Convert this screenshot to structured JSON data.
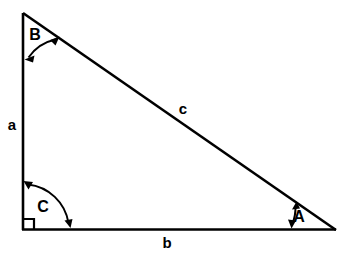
{
  "diagram": {
    "type": "right-triangle",
    "background_color": "#ffffff",
    "stroke_color": "#000000",
    "angles": [
      {
        "id": "A",
        "label": "A",
        "vertex": "bottom-right",
        "label_x": 299,
        "label_y": 218,
        "marker": "double-headed-arc"
      },
      {
        "id": "B",
        "label": "B",
        "vertex": "top",
        "label_x": 35,
        "label_y": 36,
        "marker": "double-headed-arc"
      },
      {
        "id": "C",
        "label": "C",
        "vertex": "bottom-left",
        "label_x": 43,
        "label_y": 208,
        "marker": "double-headed-arc",
        "right_angle": true
      }
    ],
    "sides": [
      {
        "id": "a",
        "label": "a",
        "position": "left-vertical",
        "label_x": 12,
        "label_y": 126,
        "opposite_angle": "A"
      },
      {
        "id": "b",
        "label": "b",
        "position": "bottom-horizontal",
        "label_x": 167,
        "label_y": 244,
        "opposite_angle": "B"
      },
      {
        "id": "c",
        "label": "c",
        "position": "hypotenuse",
        "label_x": 183,
        "label_y": 110,
        "opposite_angle": "C"
      }
    ],
    "vertices": {
      "top": {
        "x": 23,
        "y": 13
      },
      "bottom_left": {
        "x": 23,
        "y": 230
      },
      "bottom_right": {
        "x": 336,
        "y": 230
      }
    },
    "right_angle_marker": {
      "x": 23,
      "y": 230,
      "size": 11
    }
  }
}
